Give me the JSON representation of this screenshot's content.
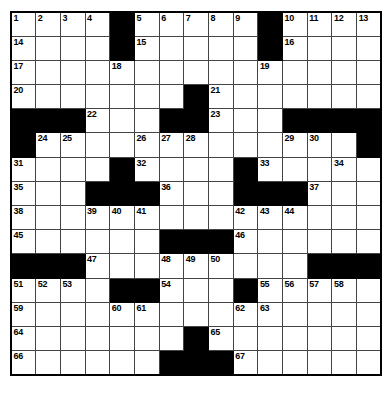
{
  "puzzle": {
    "kind": "crossword-grid",
    "rows": 15,
    "columns": 15,
    "cell_background": "#ffffff",
    "block_color": "#000000",
    "grid_line_color": "#444444",
    "border_color": "#000000",
    "page_background": "#ffffff",
    "number_color": "#000000",
    "highest_clue_number": 67,
    "grid": [
      [
        {
          "t": "open",
          "n": "1"
        },
        {
          "t": "open",
          "n": "2"
        },
        {
          "t": "open",
          "n": "3"
        },
        {
          "t": "open",
          "n": "4"
        },
        {
          "t": "block"
        },
        {
          "t": "open",
          "n": "5"
        },
        {
          "t": "open",
          "n": "6"
        },
        {
          "t": "open",
          "n": "7"
        },
        {
          "t": "open",
          "n": "8"
        },
        {
          "t": "open",
          "n": "9"
        },
        {
          "t": "block"
        },
        {
          "t": "open",
          "n": "10"
        },
        {
          "t": "open",
          "n": "11"
        },
        {
          "t": "open",
          "n": "12"
        },
        {
          "t": "open",
          "n": "13"
        }
      ],
      [
        {
          "t": "open",
          "n": "14"
        },
        {
          "t": "open"
        },
        {
          "t": "open"
        },
        {
          "t": "open"
        },
        {
          "t": "block"
        },
        {
          "t": "open",
          "n": "15"
        },
        {
          "t": "open"
        },
        {
          "t": "open"
        },
        {
          "t": "open"
        },
        {
          "t": "open"
        },
        {
          "t": "block"
        },
        {
          "t": "open",
          "n": "16"
        },
        {
          "t": "open"
        },
        {
          "t": "open"
        },
        {
          "t": "open"
        }
      ],
      [
        {
          "t": "open",
          "n": "17"
        },
        {
          "t": "open"
        },
        {
          "t": "open"
        },
        {
          "t": "open"
        },
        {
          "t": "open",
          "n": "18"
        },
        {
          "t": "open"
        },
        {
          "t": "open"
        },
        {
          "t": "open"
        },
        {
          "t": "open"
        },
        {
          "t": "open"
        },
        {
          "t": "open",
          "n": "19"
        },
        {
          "t": "open"
        },
        {
          "t": "open"
        },
        {
          "t": "open"
        },
        {
          "t": "open"
        }
      ],
      [
        {
          "t": "open",
          "n": "20"
        },
        {
          "t": "open"
        },
        {
          "t": "open"
        },
        {
          "t": "open"
        },
        {
          "t": "open"
        },
        {
          "t": "open"
        },
        {
          "t": "open"
        },
        {
          "t": "block"
        },
        {
          "t": "open",
          "n": "21"
        },
        {
          "t": "open"
        },
        {
          "t": "open"
        },
        {
          "t": "open"
        },
        {
          "t": "open"
        },
        {
          "t": "open"
        },
        {
          "t": "open"
        }
      ],
      [
        {
          "t": "block"
        },
        {
          "t": "block"
        },
        {
          "t": "block"
        },
        {
          "t": "open",
          "n": "22"
        },
        {
          "t": "open"
        },
        {
          "t": "open"
        },
        {
          "t": "block"
        },
        {
          "t": "block"
        },
        {
          "t": "open",
          "n": "23"
        },
        {
          "t": "open"
        },
        {
          "t": "open"
        },
        {
          "t": "block"
        },
        {
          "t": "block"
        },
        {
          "t": "block"
        },
        {
          "t": "block"
        }
      ],
      [
        {
          "t": "block"
        },
        {
          "t": "open",
          "n": "24"
        },
        {
          "t": "open",
          "n": "25"
        },
        {
          "t": "open"
        },
        {
          "t": "open"
        },
        {
          "t": "open",
          "n": "26"
        },
        {
          "t": "open",
          "n": "27"
        },
        {
          "t": "open",
          "n": "28"
        },
        {
          "t": "open"
        },
        {
          "t": "open"
        },
        {
          "t": "open"
        },
        {
          "t": "open",
          "n": "29"
        },
        {
          "t": "open",
          "n": "30"
        },
        {
          "t": "open"
        },
        {
          "t": "block"
        }
      ],
      [
        {
          "t": "open",
          "n": "31"
        },
        {
          "t": "open"
        },
        {
          "t": "open"
        },
        {
          "t": "open"
        },
        {
          "t": "block"
        },
        {
          "t": "open",
          "n": "32"
        },
        {
          "t": "open"
        },
        {
          "t": "open"
        },
        {
          "t": "open"
        },
        {
          "t": "block"
        },
        {
          "t": "open",
          "n": "33"
        },
        {
          "t": "open"
        },
        {
          "t": "open"
        },
        {
          "t": "open",
          "n": "34"
        },
        {
          "t": "open"
        }
      ],
      [
        {
          "t": "open",
          "n": "35"
        },
        {
          "t": "open"
        },
        {
          "t": "open"
        },
        {
          "t": "block"
        },
        {
          "t": "block"
        },
        {
          "t": "block"
        },
        {
          "t": "open",
          "n": "36"
        },
        {
          "t": "open"
        },
        {
          "t": "open"
        },
        {
          "t": "block"
        },
        {
          "t": "block"
        },
        {
          "t": "block"
        },
        {
          "t": "open",
          "n": "37"
        },
        {
          "t": "open"
        },
        {
          "t": "open"
        }
      ],
      [
        {
          "t": "open",
          "n": "38"
        },
        {
          "t": "open"
        },
        {
          "t": "open"
        },
        {
          "t": "open",
          "n": "39"
        },
        {
          "t": "open",
          "n": "40"
        },
        {
          "t": "open",
          "n": "41"
        },
        {
          "t": "open"
        },
        {
          "t": "open"
        },
        {
          "t": "open"
        },
        {
          "t": "open",
          "n": "42"
        },
        {
          "t": "open",
          "n": "43"
        },
        {
          "t": "open",
          "n": "44"
        },
        {
          "t": "open"
        },
        {
          "t": "open"
        },
        {
          "t": "open"
        }
      ],
      [
        {
          "t": "open",
          "n": "45"
        },
        {
          "t": "open"
        },
        {
          "t": "open"
        },
        {
          "t": "open"
        },
        {
          "t": "open"
        },
        {
          "t": "open"
        },
        {
          "t": "block"
        },
        {
          "t": "block"
        },
        {
          "t": "block"
        },
        {
          "t": "open",
          "n": "46"
        },
        {
          "t": "open"
        },
        {
          "t": "open"
        },
        {
          "t": "open"
        },
        {
          "t": "open"
        },
        {
          "t": "open"
        }
      ],
      [
        {
          "t": "block"
        },
        {
          "t": "block"
        },
        {
          "t": "block"
        },
        {
          "t": "open",
          "n": "47"
        },
        {
          "t": "open"
        },
        {
          "t": "open"
        },
        {
          "t": "open",
          "n": "48"
        },
        {
          "t": "open",
          "n": "49"
        },
        {
          "t": "open",
          "n": "50"
        },
        {
          "t": "open"
        },
        {
          "t": "open"
        },
        {
          "t": "open"
        },
        {
          "t": "block"
        },
        {
          "t": "block"
        },
        {
          "t": "block"
        }
      ],
      [
        {
          "t": "open",
          "n": "51"
        },
        {
          "t": "open",
          "n": "52"
        },
        {
          "t": "open",
          "n": "53"
        },
        {
          "t": "open"
        },
        {
          "t": "block"
        },
        {
          "t": "block"
        },
        {
          "t": "open",
          "n": "54"
        },
        {
          "t": "open"
        },
        {
          "t": "open"
        },
        {
          "t": "block"
        },
        {
          "t": "open",
          "n": "55"
        },
        {
          "t": "open",
          "n": "56"
        },
        {
          "t": "open",
          "n": "57"
        },
        {
          "t": "open",
          "n": "58"
        },
        {
          "t": "open"
        }
      ],
      [
        {
          "t": "open",
          "n": "59"
        },
        {
          "t": "open"
        },
        {
          "t": "open"
        },
        {
          "t": "open"
        },
        {
          "t": "open",
          "n": "60"
        },
        {
          "t": "open",
          "n": "61"
        },
        {
          "t": "open"
        },
        {
          "t": "open"
        },
        {
          "t": "open"
        },
        {
          "t": "open",
          "n": "62"
        },
        {
          "t": "open",
          "n": "63"
        },
        {
          "t": "open"
        },
        {
          "t": "open"
        },
        {
          "t": "open"
        },
        {
          "t": "open"
        }
      ],
      [
        {
          "t": "open",
          "n": "64"
        },
        {
          "t": "open"
        },
        {
          "t": "open"
        },
        {
          "t": "open"
        },
        {
          "t": "open"
        },
        {
          "t": "open"
        },
        {
          "t": "open"
        },
        {
          "t": "block"
        },
        {
          "t": "open",
          "n": "65"
        },
        {
          "t": "open"
        },
        {
          "t": "open"
        },
        {
          "t": "open"
        },
        {
          "t": "open"
        },
        {
          "t": "open"
        },
        {
          "t": "open"
        }
      ],
      [
        {
          "t": "open",
          "n": "66"
        },
        {
          "t": "open"
        },
        {
          "t": "open"
        },
        {
          "t": "open"
        },
        {
          "t": "open"
        },
        {
          "t": "open"
        },
        {
          "t": "block"
        },
        {
          "t": "block"
        },
        {
          "t": "block"
        },
        {
          "t": "open",
          "n": "67"
        },
        {
          "t": "open"
        },
        {
          "t": "open"
        },
        {
          "t": "open"
        },
        {
          "t": "open"
        },
        {
          "t": "open"
        }
      ]
    ]
  }
}
